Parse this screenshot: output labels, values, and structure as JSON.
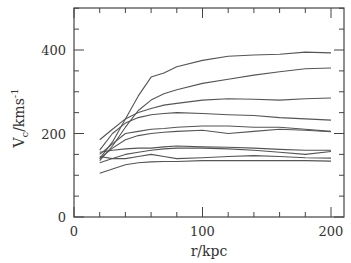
{
  "chart_data": {
    "type": "line",
    "title": "",
    "xlabel": "r/kpc",
    "ylabel": "V_c/kms^-1",
    "xlim": [
      0,
      210
    ],
    "ylim": [
      0,
      500
    ],
    "xticks": [
      0,
      100,
      200
    ],
    "yticks": [
      0,
      200,
      400
    ],
    "x_minor_step": 20,
    "y_minor_step": 50,
    "grid": false,
    "legend": null,
    "x": [
      20,
      30,
      40,
      50,
      60,
      70,
      80,
      100,
      120,
      140,
      160,
      180,
      200
    ],
    "series": [
      {
        "name": "curve-1",
        "values": [
          140,
          180,
          235,
          290,
          335,
          345,
          360,
          375,
          385,
          388,
          390,
          395,
          393
        ]
      },
      {
        "name": "curve-2",
        "values": [
          135,
          170,
          215,
          255,
          280,
          295,
          305,
          320,
          330,
          340,
          348,
          355,
          357
        ]
      },
      {
        "name": "curve-3",
        "values": [
          185,
          210,
          235,
          250,
          260,
          268,
          272,
          280,
          283,
          282,
          280,
          283,
          285
        ]
      },
      {
        "name": "curve-4",
        "values": [
          160,
          200,
          225,
          238,
          245,
          248,
          250,
          248,
          245,
          243,
          238,
          235,
          232
        ]
      },
      {
        "name": "curve-5",
        "values": [
          150,
          175,
          200,
          205,
          210,
          212,
          215,
          218,
          218,
          215,
          215,
          210,
          205
        ]
      },
      {
        "name": "curve-6",
        "values": [
          140,
          165,
          185,
          195,
          200,
          203,
          205,
          208,
          200,
          205,
          210,
          208,
          204
        ]
      },
      {
        "name": "curve-7",
        "values": [
          155,
          160,
          163,
          165,
          165,
          168,
          170,
          168,
          167,
          165,
          162,
          160,
          160
        ]
      },
      {
        "name": "curve-8",
        "values": [
          130,
          140,
          150,
          155,
          160,
          163,
          165,
          165,
          163,
          160,
          155,
          150,
          157
        ]
      },
      {
        "name": "curve-9",
        "values": [
          145,
          140,
          140,
          145,
          150,
          145,
          140,
          142,
          145,
          147,
          145,
          142,
          141
        ]
      },
      {
        "name": "curve-10",
        "values": [
          105,
          115,
          125,
          130,
          132,
          133,
          133,
          135,
          135,
          135,
          135,
          135,
          134
        ]
      }
    ]
  }
}
